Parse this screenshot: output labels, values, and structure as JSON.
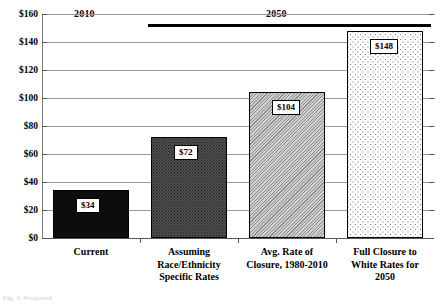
{
  "chart_data": {
    "type": "bar",
    "title": "",
    "xlabel": "",
    "ylabel": "",
    "ylim": [
      0,
      160
    ],
    "grid": true,
    "legend_position": "none",
    "categories": [
      "Current",
      "Assuming\nRace/Ethnicity\nSpecific Rates",
      "Avg. Rate of\nClosure, 1980-2010",
      "Full Closure to\nWhite Rates for\n2050"
    ],
    "values": [
      34,
      72,
      104,
      148
    ],
    "data_labels": [
      "$34",
      "$72",
      "$104",
      "$148"
    ],
    "ytick_labels": [
      "$0",
      "$20",
      "$40",
      "$60",
      "$80",
      "$100",
      "$120",
      "$140",
      "$160"
    ],
    "ytick_values": [
      0,
      20,
      40,
      60,
      80,
      100,
      120,
      140,
      160
    ],
    "annotations": [
      {
        "text": "2010",
        "spans_categories": [
          0
        ]
      },
      {
        "text": "2050",
        "spans_categories": [
          1,
          2,
          3
        ]
      }
    ],
    "series_fills": [
      "solid-black",
      "dark-dotted",
      "gray-hatched",
      "light-dotted"
    ]
  },
  "eras": {
    "era_2010": "2010",
    "era_2050": "2050"
  },
  "caption": {
    "sliver_text": "Fig. 3. Projected"
  },
  "colors": {
    "bar1": "#0d0d0d",
    "bar2": "#4f4f4f",
    "bar3": "#b4b4b4",
    "bar4": "#fdfdfd",
    "grid": "#9a9a9a",
    "axis": "#555555",
    "text": "#000000"
  }
}
